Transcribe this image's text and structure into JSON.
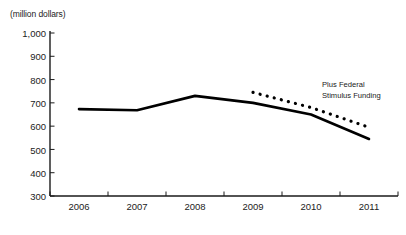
{
  "chart_data": {
    "type": "line",
    "title": "",
    "subtitle": "",
    "xlabel": "",
    "ylabel": "(million dollars)",
    "unit_label": "(million dollars)",
    "categories": [
      "2006",
      "2007",
      "2008",
      "2009",
      "2010",
      "2011"
    ],
    "x": [
      2006,
      2007,
      2008,
      2009,
      2010,
      2011
    ],
    "xlim": [
      2005.5,
      2011.5
    ],
    "ylim": [
      300,
      1000
    ],
    "ytick_labels": [
      "300",
      "400",
      "500",
      "600",
      "700",
      "800",
      "900",
      "1,000"
    ],
    "ytick_values": [
      300,
      400,
      500,
      600,
      700,
      800,
      900,
      1000
    ],
    "xtick_labels": [
      "2006",
      "2007",
      "2008",
      "2009",
      "2010",
      "2011"
    ],
    "grid": false,
    "legend_position": "none",
    "series": [
      {
        "name": "Base Funding",
        "style": "solid",
        "color": "#000000",
        "x": [
          2006,
          2007,
          2008,
          2009,
          2010,
          2011
        ],
        "values": [
          673,
          668,
          730,
          700,
          650,
          545
        ]
      },
      {
        "name": "Plus Federal Stimulus Funding",
        "style": "dotted",
        "color": "#000000",
        "x": [
          2009,
          2010,
          2011
        ],
        "values": [
          745,
          680,
          595
        ]
      }
    ],
    "annotations": [
      {
        "name": "stimulus-annotation",
        "line1": "Plus Federal",
        "line2": "Stimulus Funding",
        "x": 2010.2,
        "y": 790
      }
    ]
  },
  "axis": {
    "unit_label": "(million dollars)",
    "y_ticks": [
      {
        "label": "1,000",
        "value": 1000
      },
      {
        "label": "900",
        "value": 900
      },
      {
        "label": "800",
        "value": 800
      },
      {
        "label": "700",
        "value": 700
      },
      {
        "label": "600",
        "value": 600
      },
      {
        "label": "500",
        "value": 500
      },
      {
        "label": "400",
        "value": 400
      },
      {
        "label": "300",
        "value": 300
      }
    ],
    "x_ticks": [
      {
        "label": "2006"
      },
      {
        "label": "2007"
      },
      {
        "label": "2008"
      },
      {
        "label": "2009"
      },
      {
        "label": "2010"
      },
      {
        "label": "2011"
      }
    ]
  },
  "annotation": {
    "line1": "Plus Federal",
    "line2": "Stimulus Funding"
  },
  "colors": {
    "axis": "#1a1a1a",
    "series": "#000000",
    "background": "#ffffff",
    "text": "#222222"
  }
}
